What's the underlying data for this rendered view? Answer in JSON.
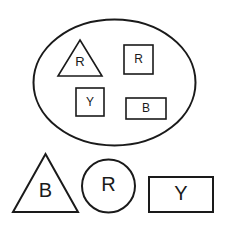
{
  "figure": {
    "background_color": "#ffffff",
    "stroke_color": "#1a1a1a",
    "label_color": "#1a1a1a",
    "container": {
      "name": "ellipse",
      "label": "",
      "cx": 114.5,
      "cy": 82.5,
      "rx": 81,
      "ry": 63,
      "stroke_width": 2
    },
    "inside_shapes": [
      {
        "name": "triangle",
        "label": "R",
        "apex_x": 80,
        "apex_y": 40,
        "left_x": 58,
        "right_x": 102,
        "base_y": 76,
        "label_x": 80,
        "label_y": 63,
        "font_size": 13,
        "stroke_width": 1.6
      },
      {
        "name": "square",
        "label": "R",
        "x": 124,
        "y": 45,
        "width": 29,
        "height": 29,
        "label_x": 138.5,
        "label_y": 60,
        "font_size": 12,
        "stroke_width": 1.6
      },
      {
        "name": "square",
        "label": "Y",
        "x": 76,
        "y": 88,
        "width": 28,
        "height": 28,
        "label_x": 90,
        "label_y": 102.5,
        "font_size": 12,
        "stroke_width": 1.6
      },
      {
        "name": "rectangle",
        "label": "B",
        "x": 126,
        "y": 98,
        "width": 40,
        "height": 21,
        "label_x": 146,
        "label_y": 109,
        "font_size": 12,
        "stroke_width": 1.6
      }
    ],
    "outside_shapes": [
      {
        "name": "triangle",
        "label": "B",
        "apex_x": 45.5,
        "apex_y": 154,
        "left_x": 13,
        "right_x": 78,
        "base_y": 212,
        "label_x": 45.5,
        "label_y": 192,
        "font_size": 20,
        "stroke_width": 2
      },
      {
        "name": "circle",
        "label": "R",
        "cx": 108.5,
        "cy": 186,
        "r": 26.5,
        "label_x": 108.5,
        "label_y": 186,
        "font_size": 20,
        "stroke_width": 2
      },
      {
        "name": "rectangle",
        "label": "Y",
        "x": 149,
        "y": 177,
        "width": 64,
        "height": 35,
        "label_x": 181,
        "label_y": 194.5,
        "font_size": 20,
        "stroke_width": 2
      }
    ]
  }
}
